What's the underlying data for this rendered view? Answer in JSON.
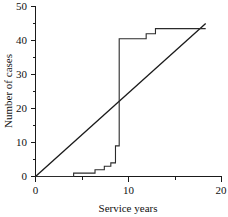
{
  "chart_data": {
    "type": "line",
    "title": "",
    "xlabel": "Service years",
    "ylabel": "Number of cases",
    "xlim": [
      0,
      20
    ],
    "ylim": [
      0,
      50
    ],
    "grid": false,
    "legend": null,
    "x_ticks_major": [
      0,
      10,
      20
    ],
    "x_tick_labels": [
      "0",
      "10",
      "20"
    ],
    "x_ticks_minor": [
      5,
      15
    ],
    "y_ticks_major": [
      0,
      10,
      20,
      30,
      40,
      50
    ],
    "y_tick_labels": [
      "0",
      "10",
      "20",
      "30",
      "40",
      "50"
    ],
    "y_ticks_minor": [
      5,
      15,
      25,
      35,
      45
    ],
    "series": [
      {
        "name": "Cumulative cases (step)",
        "type": "step",
        "x": [
          0,
          4.1,
          4.1,
          6.4,
          6.4,
          7.4,
          7.4,
          8.1,
          8.1,
          8.6,
          8.6,
          9.0,
          9.0,
          11.9,
          11.9,
          12.9,
          12.9,
          18.3
        ],
        "y": [
          0,
          0,
          1,
          1,
          2,
          2,
          3,
          3,
          4,
          4,
          9,
          9,
          40.5,
          40.5,
          42,
          42,
          43.5,
          43.5
        ]
      },
      {
        "name": "Reference line",
        "type": "line",
        "x": [
          0,
          18.3
        ],
        "y": [
          0,
          45
        ]
      }
    ],
    "annotations": []
  }
}
